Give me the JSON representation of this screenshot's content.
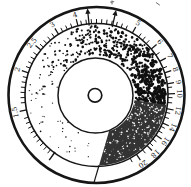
{
  "figure": {
    "type": "circular-logarithmic-dial",
    "background": "#ffffff",
    "ink": "#161616",
    "center": {
      "x": 96.5,
      "y": 95
    },
    "radii": {
      "outer_rim": 88,
      "scale_circle": 71.5,
      "stipple_outer": 69.3,
      "stipple_inner": 39.2,
      "inner_disc": 37.5,
      "hub_hole": 6.8,
      "label_ring": 82.5
    },
    "scale": {
      "labels": [
        {
          "text": "1.5",
          "angle": 258
        },
        {
          "text": "2",
          "angle": 288
        },
        {
          "text": "2.5",
          "angle": 309
        },
        {
          "text": "3",
          "angle": 328
        },
        {
          "text": "4",
          "angle": 345
        },
        {
          "text": "5",
          "angle": 30
        },
        {
          "text": "6",
          "angle": 50
        },
        {
          "text": "7",
          "angle": 62
        },
        {
          "text": "8",
          "angle": 72
        },
        {
          "text": "9",
          "angle": 81
        },
        {
          "text": "10",
          "angle": 89
        },
        {
          "text": "12",
          "angle": 101
        },
        {
          "text": "14",
          "angle": 113
        },
        {
          "text": "16",
          "angle": 124
        },
        {
          "text": "18",
          "angle": 135
        },
        {
          "text": "20",
          "angle": 146
        }
      ],
      "minor_tick_step_deg": 4,
      "tick_arc_start_deg": 216,
      "tick_arc_end_deg": 512,
      "start_long_tick_angle": 216,
      "label_font_px": 7
    },
    "pointers": {
      "arrow_angles": [
        354,
        13
      ]
    },
    "density_wedge": {
      "fill": "#333333",
      "start_angle": 98,
      "edge_outer_angle": 178,
      "edge_inner_angle": 161
    },
    "stipple": {
      "dot_color": "#101010",
      "speckle_color": "#f5f5f5",
      "gradient_start_angle": 185,
      "gradient_sweep_deg": 273,
      "dot_attempts": 2400,
      "speckle_count": 250,
      "seed": 1337
    },
    "stray_marks_color": "#5a5a5a"
  }
}
